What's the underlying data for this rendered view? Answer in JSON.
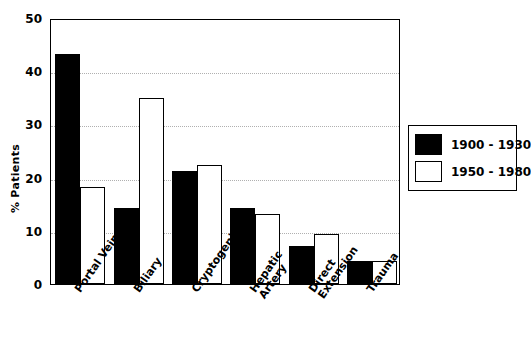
{
  "chart_data": {
    "type": "bar",
    "title": "",
    "xlabel": "",
    "ylabel": "% Patients",
    "ylim": [
      0,
      50
    ],
    "yticks": [
      0,
      10,
      20,
      30,
      40,
      50
    ],
    "ytick_labels": [
      "0",
      "10",
      "20",
      "30",
      "40",
      "50"
    ],
    "grid": true,
    "grid_axis": "y",
    "legend_position": "right",
    "categories": [
      "Portal Vein",
      "Biliary",
      "Cryptogenic",
      "Hepatic Artery",
      "Direct Extension",
      "Trauma"
    ],
    "category_lines": [
      [
        "Portal Vein"
      ],
      [
        "Biliary"
      ],
      [
        "Cryptogenic"
      ],
      [
        "Hepatic",
        "Artery"
      ],
      [
        "Direct",
        "Extension"
      ],
      [
        "Trauma"
      ]
    ],
    "series": [
      {
        "name": "1900 - 1930",
        "fill": "solid-black",
        "color": "#000000",
        "values": [
          43.3,
          14.2,
          21.3,
          14.3,
          7.2,
          4.3
        ]
      },
      {
        "name": "1950 - 1980",
        "fill": "stipple-gray",
        "color": "#cccccc",
        "values": [
          18.2,
          35.0,
          22.3,
          13.1,
          9.4,
          4.3
        ]
      }
    ]
  },
  "legend": {
    "entries": [
      {
        "label": "1900 - 1930"
      },
      {
        "label": "1950 - 1980"
      }
    ]
  }
}
